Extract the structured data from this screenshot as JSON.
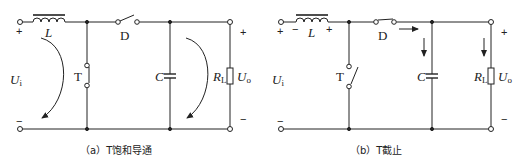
{
  "panels": [
    {
      "id": "a",
      "caption": "（a）T饱和导通",
      "labels": {
        "inductor": "L",
        "diode_switch": "D",
        "transistor_switch": "T",
        "capacitor": "C",
        "load_main": "R",
        "load_sub": "L",
        "input_main": "U",
        "input_sub": "i",
        "output_main": "U",
        "output_sub": "o"
      },
      "signs": {
        "input_plus": "+",
        "input_minus": "−",
        "output_plus": "+",
        "output_minus": "−"
      },
      "switch_states": {
        "T": "closed",
        "D": "open"
      }
    },
    {
      "id": "b",
      "caption": "（b）T截止",
      "labels": {
        "inductor": "L",
        "diode_switch": "D",
        "transistor_switch": "T",
        "capacitor": "C",
        "load_main": "R",
        "load_sub": "L",
        "input_main": "U",
        "input_sub": "i",
        "output_main": "U",
        "output_sub": "o"
      },
      "signs": {
        "input_plus": "+",
        "input_minus": "−",
        "inductor_minus": "−",
        "inductor_plus": "+",
        "output_plus": "+",
        "output_minus": "−"
      },
      "switch_states": {
        "T": "open",
        "D": "closed"
      }
    }
  ],
  "colors": {
    "line": "#222222",
    "background": "#ffffff"
  }
}
